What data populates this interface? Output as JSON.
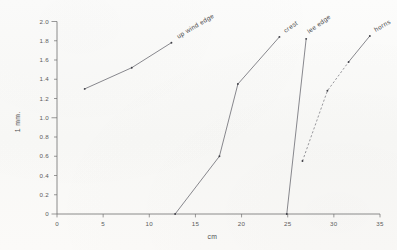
{
  "chart_data": {
    "type": "line",
    "title": "",
    "xlabel": "cm",
    "ylabel": "1 mm.",
    "xlim": [
      0,
      35
    ],
    "ylim": [
      0,
      2.0
    ],
    "xticks": [
      0,
      5,
      10,
      15,
      20,
      25,
      30,
      35
    ],
    "xtick_labels": [
      "0",
      "5",
      "10",
      "15",
      "20",
      "25",
      "30",
      "35"
    ],
    "yticks": [
      0,
      0.2,
      0.4,
      0.6,
      0.8,
      1.0,
      1.2,
      1.4,
      1.6,
      1.8,
      2.0
    ],
    "ytick_labels": [
      "0",
      "0.2",
      "0.4",
      "0.6",
      "0.8",
      "1.0",
      "1.2",
      "1.4",
      "1.6",
      "1.8",
      "2.0"
    ],
    "grid": false,
    "legend_position": "inline-end-of-line",
    "series": [
      {
        "name": "up wind edge",
        "label": "up wind edge",
        "style": "solid",
        "points": [
          {
            "x": 3.0,
            "y": 1.3
          },
          {
            "x": 8.1,
            "y": 1.52
          },
          {
            "x": 12.4,
            "y": 1.78
          }
        ]
      },
      {
        "name": "crest",
        "label": "crest",
        "style": "solid",
        "points": [
          {
            "x": 12.8,
            "y": 0.0
          },
          {
            "x": 17.6,
            "y": 0.6
          },
          {
            "x": 19.6,
            "y": 1.35
          },
          {
            "x": 24.1,
            "y": 1.84
          }
        ]
      },
      {
        "name": "lee edge",
        "label": "lee edge",
        "style": "solid",
        "points": [
          {
            "x": 24.9,
            "y": 0.0
          },
          {
            "x": 27.0,
            "y": 1.82
          }
        ]
      },
      {
        "name": "horns",
        "label": "horns",
        "style": "dashed-then-solid",
        "dash_until_index": 2,
        "points": [
          {
            "x": 26.6,
            "y": 0.55
          },
          {
            "x": 29.3,
            "y": 1.28
          },
          {
            "x": 31.6,
            "y": 1.58
          },
          {
            "x": 33.9,
            "y": 1.85
          }
        ]
      }
    ]
  },
  "figure": {
    "axis_color": "#6f6f6f",
    "line_color": "#62626a",
    "point_color": "#3f3f46",
    "text_color": "#4f4f4f",
    "background": "#fbfbfa"
  }
}
